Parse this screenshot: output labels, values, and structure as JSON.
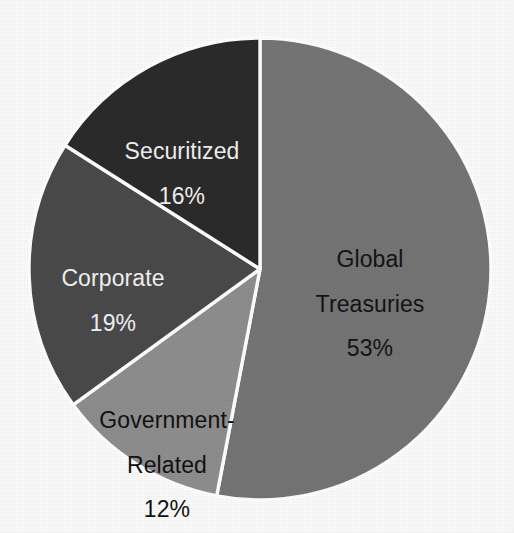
{
  "chart_data": {
    "type": "pie",
    "title": "",
    "subtitle": "",
    "xlabel": "",
    "ylabel": "",
    "legend_position": "none",
    "grid": false,
    "labels_inside": true,
    "value_suffix": "%",
    "start_angle_deg": 0,
    "direction": "clockwise",
    "categories": [
      "Global Treasuries",
      "Government-Related",
      "Corporate",
      "Securitized"
    ],
    "values": [
      53,
      12,
      19,
      16
    ],
    "slices": [
      {
        "name": "Global Treasuries",
        "label_line1": "Global",
        "label_line2": "Treasuries",
        "value": 53,
        "value_text": "53%",
        "color": "#757575",
        "text_color": "#141414",
        "start_deg": 0,
        "end_deg": 190.8
      },
      {
        "name": "Government-Related",
        "label_line1": "Government-",
        "label_line2": "Related",
        "value": 12,
        "value_text": "12%",
        "color": "#8e8e8e",
        "text_color": "#121212",
        "start_deg": 190.8,
        "end_deg": 234.0
      },
      {
        "name": "Corporate",
        "label_line1": "Corporate",
        "label_line2": "",
        "value": 19,
        "value_text": "19%",
        "color": "#4a4a4a",
        "text_color": "#f2f2f2",
        "start_deg": 234.0,
        "end_deg": 302.4
      },
      {
        "name": "Securitized",
        "label_line1": "Securitized",
        "label_line2": "",
        "value": 16,
        "value_text": "16%",
        "color": "#2b2b2b",
        "text_color": "#f0f0f0",
        "start_deg": 302.4,
        "end_deg": 360.0
      }
    ],
    "total": 100,
    "background_color": "#fbfbfb",
    "separator_color": "#ffffff"
  }
}
